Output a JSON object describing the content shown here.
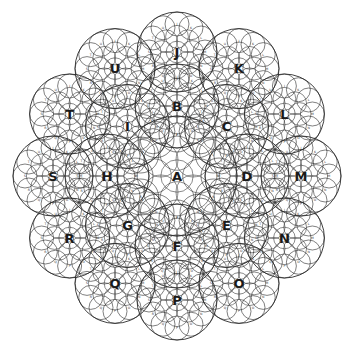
{
  "diagram": {
    "title": "",
    "center": [
      177,
      176
    ],
    "stroke_color": "#2a2a2a",
    "background": "#ffffff",
    "hub": {
      "label": "A",
      "x": 177,
      "y": 176,
      "r": 60
    },
    "inner_ring": {
      "radius": 70,
      "circle_r": 42,
      "nodes": [
        {
          "label": "B",
          "angle": -90
        },
        {
          "label": "C",
          "angle": -45
        },
        {
          "label": "D",
          "angle": 0
        },
        {
          "label": "E",
          "angle": 45
        },
        {
          "label": "F",
          "angle": 90
        },
        {
          "label": "G",
          "angle": 135
        },
        {
          "label": "H",
          "angle": 180
        },
        {
          "label": "I",
          "angle": 225
        }
      ]
    },
    "outer_ring": {
      "radius": 124,
      "circle_r": 40,
      "nodes": [
        {
          "label": "J",
          "angle": -90
        },
        {
          "label": "K",
          "angle": -60
        },
        {
          "label": "L",
          "angle": -30
        },
        {
          "label": "M",
          "angle": 0
        },
        {
          "label": "N",
          "angle": 30
        },
        {
          "label": "O",
          "angle": 60
        },
        {
          "label": "P",
          "angle": 90
        },
        {
          "label": "Q",
          "angle": 120
        },
        {
          "label": "R",
          "angle": 150
        },
        {
          "label": "S",
          "angle": 180
        },
        {
          "label": "T",
          "angle": 210
        },
        {
          "label": "U",
          "angle": 240
        }
      ]
    },
    "subcircle_labels": [
      "J",
      "K",
      "L",
      "M",
      "N",
      "O",
      "P",
      "Q",
      "R",
      "S",
      "T",
      "U"
    ]
  }
}
